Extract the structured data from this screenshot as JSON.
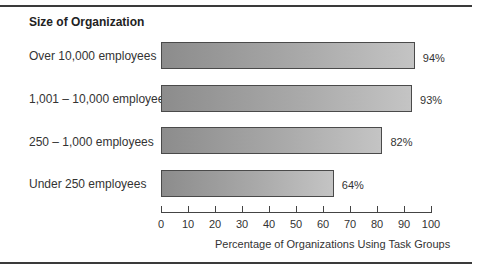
{
  "chart_data": {
    "type": "bar",
    "orientation": "horizontal",
    "title": "Size of Organization",
    "xlabel": "Percentage of Organizations Using Task Groups",
    "ylabel": "",
    "categories": [
      "Over 10,000 employees",
      "1,001 – 10,000 employees",
      "250 – 1,000 employees",
      "Under 250 employees"
    ],
    "values": [
      94,
      93,
      82,
      64
    ],
    "value_labels": [
      "94%",
      "93%",
      "82%",
      "64%"
    ],
    "xlim": [
      0,
      100
    ],
    "xticks": [
      "0",
      "10",
      "20",
      "30",
      "40",
      "50",
      "60",
      "70",
      "80",
      "90",
      "100"
    ],
    "grid": false,
    "legend": null,
    "bar_color": "#a9a9a9"
  }
}
